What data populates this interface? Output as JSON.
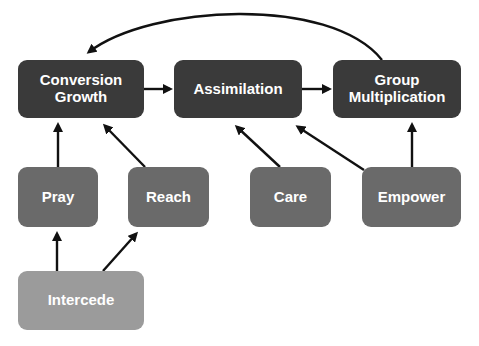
{
  "diagram": {
    "nodes": [
      {
        "id": "conversion-growth",
        "label_line1": "Conversion",
        "label_line2": "Growth",
        "tier": "top",
        "color": "#3a3a3a"
      },
      {
        "id": "assimilation",
        "label": "Assimilation",
        "tier": "top",
        "color": "#3a3a3a"
      },
      {
        "id": "group-multiplication",
        "label_line1": "Group",
        "label_line2": "Multiplication",
        "tier": "top",
        "color": "#3a3a3a"
      },
      {
        "id": "pray",
        "label": "Pray",
        "tier": "middle",
        "color": "#6a6a6a"
      },
      {
        "id": "reach",
        "label": "Reach",
        "tier": "middle",
        "color": "#6a6a6a"
      },
      {
        "id": "care",
        "label": "Care",
        "tier": "middle",
        "color": "#6a6a6a"
      },
      {
        "id": "empower",
        "label": "Empower",
        "tier": "middle",
        "color": "#6a6a6a"
      },
      {
        "id": "intercede",
        "label": "Intercede",
        "tier": "bottom",
        "color": "#9b9b9b"
      }
    ],
    "edges": [
      {
        "from": "conversion-growth",
        "to": "assimilation"
      },
      {
        "from": "assimilation",
        "to": "group-multiplication"
      },
      {
        "from": "group-multiplication",
        "to": "conversion-growth",
        "style": "curved"
      },
      {
        "from": "pray",
        "to": "conversion-growth"
      },
      {
        "from": "reach",
        "to": "conversion-growth"
      },
      {
        "from": "care",
        "to": "assimilation"
      },
      {
        "from": "empower",
        "to": "assimilation"
      },
      {
        "from": "empower",
        "to": "group-multiplication"
      },
      {
        "from": "intercede",
        "to": "pray"
      },
      {
        "from": "intercede",
        "to": "reach"
      }
    ]
  }
}
